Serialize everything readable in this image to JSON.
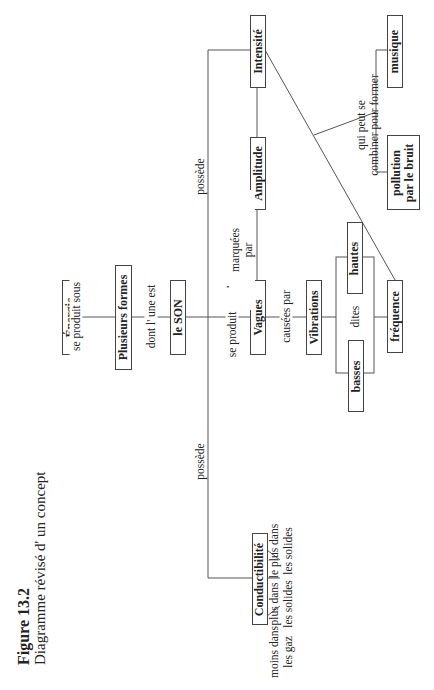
{
  "caption": {
    "figure": "Figure 13.2",
    "title": "Diagramme révisé d' un concept"
  },
  "nodes": {
    "energie": "Énergie",
    "plusieurs_formes": "Plusieurs formes",
    "le_son": "le SON",
    "vagues": "Vagues",
    "amplitude": "Amplitude",
    "intensite": "Intensité",
    "vibrations": "Vibrations",
    "hautes": "hautes",
    "basses": "basses",
    "frequence": "fréquence",
    "musique": "musique",
    "pollution_1": "pollution",
    "pollution_2": "par le bruit",
    "conductibilite": "Conductibilité"
  },
  "links": {
    "se_produit_sous": "se produit sous",
    "dont_lune_est": "dont l' une est",
    "se_produit_par_des": "se produit par des",
    "marquees_1": "marquées",
    "marquees_2": "par",
    "causees_par": "causées par",
    "dites": "dites",
    "possede_top": "possède",
    "possede_bottom": "possède",
    "qui_peut_1": "qui peut se",
    "qui_peut_2": "combiner pour former",
    "moins_1": "moins dans",
    "moins_2": "les gaz",
    "plus_1": "plus dans",
    "plus_2": "les solides",
    "le_plus_1": "le plus dans",
    "le_plus_2": "les solides"
  }
}
